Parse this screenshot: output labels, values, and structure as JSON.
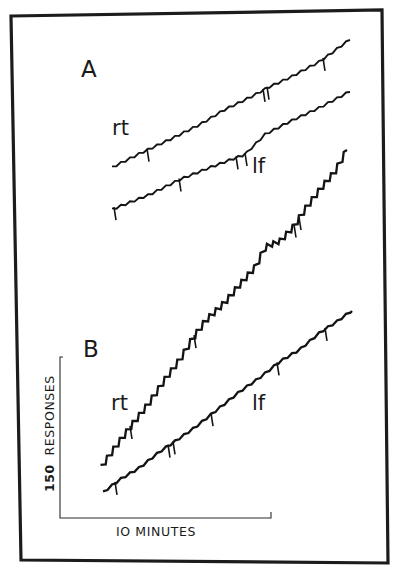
{
  "chart_data": {
    "type": "line",
    "title": "",
    "subtitle": "Cumulative response records (right vs. left key)",
    "panels": [
      {
        "label": "A",
        "series": [
          {
            "name": "rt",
            "points": [
              [
                112,
                168
              ],
              [
                140,
                154
              ],
              [
                170,
                140
              ],
              [
                200,
                125
              ],
              [
                225,
                110
              ],
              [
                250,
                98
              ],
              [
                268,
                88
              ],
              [
                290,
                78
              ],
              [
                320,
                62
              ],
              [
                350,
                40
              ]
            ],
            "pips_x": [
              147,
              263,
              267,
              323
            ]
          },
          {
            "name": "lf",
            "points": [
              [
                112,
                210
              ],
              [
                150,
                195
              ],
              [
                180,
                180
              ],
              [
                210,
                168
              ],
              [
                245,
                155
              ],
              [
                265,
                135
              ],
              [
                290,
                122
              ],
              [
                320,
                108
              ],
              [
                350,
                92
              ]
            ],
            "pips_x": [
              114,
              179,
              236,
              245
            ]
          }
        ]
      },
      {
        "label": "B",
        "series": [
          {
            "name": "rt",
            "points": [
              [
                101,
                468
              ],
              [
                115,
                448
              ],
              [
                130,
                428
              ],
              [
                148,
                405
              ],
              [
                165,
                380
              ],
              [
                180,
                360
              ],
              [
                192,
                340
              ],
              [
                205,
                322
              ],
              [
                225,
                303
              ],
              [
                240,
                285
              ],
              [
                255,
                268
              ],
              [
                265,
                248
              ],
              [
                280,
                242
              ],
              [
                293,
                228
              ],
              [
                305,
                210
              ],
              [
                320,
                190
              ],
              [
                335,
                172
              ],
              [
                347,
                150
              ]
            ],
            "pips_x": [
              130,
              194,
              294,
              299
            ]
          },
          {
            "name": "lf",
            "points": [
              [
                103,
                493
              ],
              [
                120,
                480
              ],
              [
                140,
                468
              ],
              [
                160,
                452
              ],
              [
                175,
                442
              ],
              [
                195,
                428
              ],
              [
                215,
                412
              ],
              [
                240,
                392
              ],
              [
                260,
                378
              ],
              [
                280,
                362
              ],
              [
                300,
                350
              ],
              [
                320,
                333
              ],
              [
                337,
                322
              ],
              [
                352,
                311
              ]
            ],
            "pips_x": [
              115,
              168,
              173,
              211,
              277,
              325
            ]
          }
        ]
      }
    ],
    "scale_bar": {
      "y_label_value": "150",
      "y_label_unit": "RESPONSES",
      "x_label": "10 MINUTES"
    },
    "xlabel": "10 MINUTES",
    "ylabel": "150 RESPONSES",
    "legend": [],
    "grid": false,
    "axis_ranges": {
      "x_minutes_per_bar": 10,
      "y_responses_per_bar": 150
    }
  },
  "labels": {
    "panel_a": "A",
    "panel_b": "B",
    "a_rt": "rt",
    "a_lf": "lf",
    "b_rt": "rt",
    "b_lf": "lf",
    "y_value": "150",
    "y_unit": "RESPONSES",
    "x_label": "IO MINUTES"
  }
}
